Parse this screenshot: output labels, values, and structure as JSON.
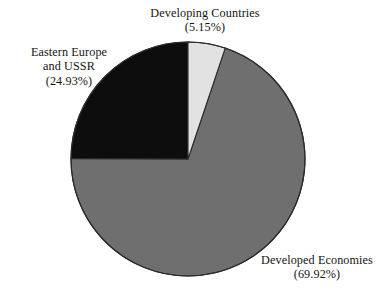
{
  "chart_data": {
    "type": "pie",
    "title": "",
    "subtitle": "",
    "xlabel": "",
    "ylabel": "",
    "legend_position": "none",
    "grid": false,
    "labels_inline": true,
    "start_angle_deg": 0,
    "direction": "clockwise",
    "categories": [
      "Developing Countries",
      "Developed Economies",
      "Eastern Europe and USSR"
    ],
    "values": [
      5.15,
      69.92,
      24.93
    ],
    "units": "percent",
    "total": 100.0,
    "slices": [
      {
        "label": "Developing Countries",
        "label_line1": "Developing Countries",
        "label_line2": "(5.15%)",
        "value": 5.15,
        "value_text": "5.15%",
        "value_paren": "(5.15%)",
        "color": "#e2e2e2",
        "start_deg": 0,
        "end_deg": 18.54
      },
      {
        "label": "Developed Economies",
        "label_line1": "Developed Economies",
        "label_line2": "(69.92%)",
        "value": 69.92,
        "value_text": "69.92%",
        "value_paren": "(69.92%)",
        "color": "#6f6f6f",
        "start_deg": 18.54,
        "end_deg": 270.25
      },
      {
        "label": "Eastern Europe and USSR",
        "label_line1": "Eastern Europe",
        "label_line2": "and USSR",
        "label_line3": "(24.93%)",
        "value": 24.93,
        "value_text": "24.93%",
        "value_paren": "(24.93%)",
        "color": "#0d0d0d",
        "start_deg": 270.25,
        "end_deg": 360
      }
    ],
    "geometry": {
      "center_x": 188,
      "center_y": 159,
      "radius": 117
    },
    "colors": {
      "developing": "#e2e2e2",
      "developed": "#6f6f6f",
      "eastern": "#0d0d0d",
      "outline": "#2b2b2b",
      "background": "#ffffff",
      "text": "#141414"
    }
  }
}
